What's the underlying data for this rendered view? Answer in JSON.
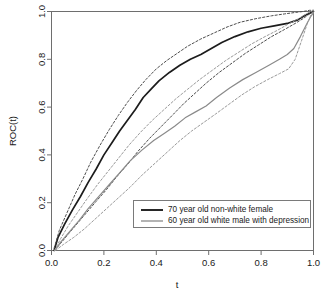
{
  "chart_data": {
    "type": "line",
    "title": "",
    "xlabel": "t",
    "ylabel": "ROC(t)",
    "xlim": [
      0,
      1
    ],
    "ylim": [
      0,
      1
    ],
    "grid": false,
    "legend_position": "bottom-right",
    "xticks": [
      "0.0",
      "0.2",
      "0.4",
      "0.6",
      "0.8",
      "1.0"
    ],
    "xtick_values": [
      0.0,
      0.2,
      0.4,
      0.6,
      0.8,
      1.0
    ],
    "yticks": [
      "0.0",
      "0.2",
      "0.4",
      "0.6",
      "0.8",
      "1.0"
    ],
    "ytick_values": [
      0.0,
      0.2,
      0.4,
      0.6,
      0.8,
      1.0
    ],
    "series": [
      {
        "name": "70 year old non-white female",
        "color": "#1c1c1c",
        "style": "solid",
        "width": 1.7,
        "x": [
          0.01,
          0.025,
          0.05,
          0.08,
          0.11,
          0.14,
          0.17,
          0.2,
          0.23,
          0.26,
          0.29,
          0.32,
          0.35,
          0.38,
          0.41,
          0.45,
          0.49,
          0.53,
          0.57,
          0.61,
          0.65,
          0.7,
          0.75,
          0.8,
          0.85,
          0.9,
          0.94,
          0.97,
          0.99,
          1.0
        ],
        "y": [
          0.0,
          0.055,
          0.11,
          0.17,
          0.225,
          0.285,
          0.34,
          0.4,
          0.45,
          0.5,
          0.545,
          0.59,
          0.64,
          0.675,
          0.71,
          0.745,
          0.775,
          0.8,
          0.82,
          0.845,
          0.87,
          0.895,
          0.915,
          0.93,
          0.94,
          0.95,
          0.965,
          0.985,
          0.995,
          1.0
        ]
      },
      {
        "name": "70 year old non-white female upper CI",
        "color": "#4d4d4d",
        "style": "dashed",
        "width": 1.0,
        "x": [
          0.01,
          0.03,
          0.06,
          0.09,
          0.12,
          0.15,
          0.185,
          0.22,
          0.255,
          0.29,
          0.325,
          0.36,
          0.4,
          0.44,
          0.48,
          0.52,
          0.57,
          0.62,
          0.67,
          0.72,
          0.78,
          0.84,
          0.89,
          0.93,
          0.96,
          0.985,
          1.0
        ],
        "y": [
          0.01,
          0.085,
          0.16,
          0.235,
          0.3,
          0.37,
          0.44,
          0.505,
          0.565,
          0.62,
          0.67,
          0.715,
          0.76,
          0.795,
          0.825,
          0.855,
          0.885,
          0.91,
          0.935,
          0.955,
          0.97,
          0.982,
          0.99,
          0.996,
          1.0,
          1.005,
          1.005
        ]
      },
      {
        "name": "70 year old non-white female lower CI",
        "color": "#4d4d4d",
        "style": "dashed",
        "width": 1.0,
        "x": [
          0.012,
          0.035,
          0.065,
          0.1,
          0.135,
          0.17,
          0.21,
          0.25,
          0.29,
          0.33,
          0.375,
          0.42,
          0.465,
          0.505,
          0.545,
          0.59,
          0.64,
          0.69,
          0.74,
          0.79,
          0.84,
          0.89,
          0.93,
          0.96,
          0.985,
          1.0
        ],
        "y": [
          0.0,
          0.03,
          0.07,
          0.115,
          0.16,
          0.205,
          0.255,
          0.31,
          0.36,
          0.415,
          0.47,
          0.52,
          0.57,
          0.615,
          0.655,
          0.7,
          0.745,
          0.785,
          0.825,
          0.86,
          0.895,
          0.925,
          0.95,
          0.97,
          0.99,
          1.0
        ]
      },
      {
        "name": "60 year old white male with depression",
        "color": "#8a8a8a",
        "style": "solid",
        "width": 1.2,
        "x": [
          0.012,
          0.035,
          0.07,
          0.105,
          0.14,
          0.18,
          0.22,
          0.26,
          0.3,
          0.345,
          0.39,
          0.43,
          0.47,
          0.51,
          0.55,
          0.59,
          0.63,
          0.68,
          0.73,
          0.78,
          0.83,
          0.87,
          0.9,
          0.925,
          0.95,
          0.975,
          0.99,
          1.0
        ],
        "y": [
          0.0,
          0.035,
          0.08,
          0.125,
          0.175,
          0.225,
          0.275,
          0.325,
          0.375,
          0.42,
          0.46,
          0.49,
          0.52,
          0.555,
          0.58,
          0.605,
          0.64,
          0.68,
          0.715,
          0.745,
          0.775,
          0.8,
          0.82,
          0.845,
          0.895,
          0.95,
          0.98,
          0.995
        ]
      },
      {
        "name": "60 year old white male with depression upper CI",
        "color": "#9a9a9a",
        "style": "dashed",
        "width": 1.0,
        "x": [
          0.012,
          0.035,
          0.065,
          0.1,
          0.135,
          0.175,
          0.215,
          0.255,
          0.295,
          0.34,
          0.385,
          0.43,
          0.475,
          0.52,
          0.565,
          0.615,
          0.665,
          0.715,
          0.765,
          0.815,
          0.86,
          0.9,
          0.935,
          0.965,
          0.985,
          1.0
        ],
        "y": [
          0.0,
          0.05,
          0.105,
          0.16,
          0.215,
          0.275,
          0.33,
          0.385,
          0.44,
          0.495,
          0.545,
          0.59,
          0.635,
          0.675,
          0.715,
          0.755,
          0.795,
          0.83,
          0.865,
          0.895,
          0.92,
          0.945,
          0.965,
          0.985,
          0.998,
          1.005
        ]
      },
      {
        "name": "60 year old white male with depression lower CI",
        "color": "#9a9a9a",
        "style": "dashed",
        "width": 1.0,
        "x": [
          0.015,
          0.045,
          0.085,
          0.125,
          0.165,
          0.21,
          0.255,
          0.3,
          0.345,
          0.395,
          0.445,
          0.49,
          0.535,
          0.58,
          0.625,
          0.675,
          0.725,
          0.775,
          0.825,
          0.87,
          0.905,
          0.93,
          0.955,
          0.975,
          0.99,
          1.0
        ],
        "y": [
          0.0,
          0.025,
          0.055,
          0.09,
          0.13,
          0.175,
          0.22,
          0.265,
          0.315,
          0.365,
          0.415,
          0.46,
          0.5,
          0.535,
          0.57,
          0.61,
          0.65,
          0.685,
          0.715,
          0.74,
          0.76,
          0.8,
          0.88,
          0.945,
          0.985,
          1.0
        ]
      }
    ],
    "legend": [
      {
        "label": "70 year old non-white female",
        "color": "#1c1c1c",
        "width": 1.9
      },
      {
        "label": "60 year old white male with depression",
        "color": "#8a8a8a",
        "width": 1.3
      }
    ]
  }
}
